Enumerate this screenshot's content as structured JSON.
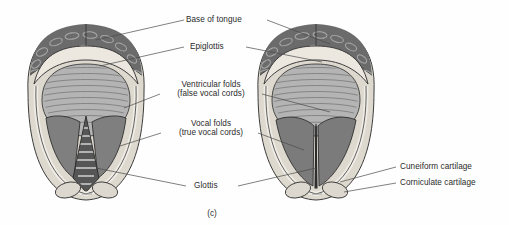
{
  "figure": {
    "caption": "(c)",
    "views": [
      {
        "name": "open-glottis",
        "description": "Glottis open during breathing"
      },
      {
        "name": "closed-glottis",
        "description": "Glottis closed during phonation"
      }
    ]
  },
  "labels": {
    "base_of_tongue": "Base of tongue",
    "epiglottis": "Epiglottis",
    "ventricular_folds_l1": "Ventricular folds",
    "ventricular_folds_l2": "(false vocal cords)",
    "vocal_folds_l1": "Vocal folds",
    "vocal_folds_l2": "(true vocal cords)",
    "glottis": "Glottis",
    "cuneiform_cartilage": "Cuneiform cartilage",
    "corniculate_cartilage": "Corniculate cartilage"
  },
  "colors": {
    "background": "#fefefe",
    "text": "#2b2b2b",
    "leader_line": "#4a4a4a",
    "tongue_base": "#6b6b6b",
    "tongue_texture": "#9c9c9c",
    "epiglottis": "#e8e4dc",
    "mucosa_rim": "#d8d3c9",
    "vestibule": "#b9b9b9",
    "vocal_fold": "#7d7d7d",
    "airway_dark": "#5a5a5a",
    "tracheal_ring": "#cfcfcf",
    "cartilage_bump": "#ddd8cf",
    "outline": "#3c3c3c"
  }
}
